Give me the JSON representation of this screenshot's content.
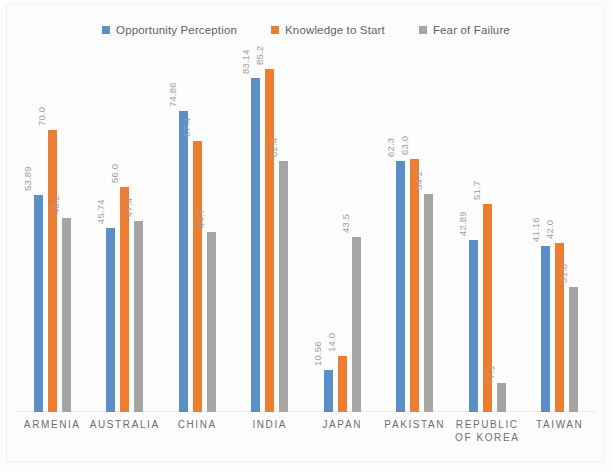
{
  "legend": {
    "position": "top-center",
    "entries": [
      {
        "label": "Opportunity Perception",
        "color": "#5B8FC7",
        "icon": "square-marker"
      },
      {
        "label": "Knowledge to Start",
        "color": "#ED7D31",
        "icon": "square-marker"
      },
      {
        "label": "Fear of Failure",
        "color": "#A5A5A5",
        "icon": "square-marker"
      }
    ]
  },
  "chart_data": {
    "type": "bar",
    "title": "",
    "subtitle": "",
    "xlabel": "",
    "ylabel": "",
    "ylim": [
      0,
      90
    ],
    "grid": false,
    "legend_position": "top-center",
    "categories": [
      "ARMENIA",
      "AUSTRALIA",
      "CHINA",
      "INDIA",
      "JAPAN",
      "PAKISTAN",
      "REPUBLIC\nOF KOREA",
      "TAIWAN"
    ],
    "series": [
      {
        "name": "Opportunity Perception",
        "color": "#5B8FC7",
        "values": [
          53.89,
          45.74,
          74.86,
          83.14,
          10.56,
          62.3,
          42.89,
          41.16
        ],
        "labels": [
          "53.89",
          "45.74",
          "74.86",
          "83.14",
          "10.56",
          "62.3",
          "42.89",
          "41.16"
        ]
      },
      {
        "name": "Knowledge to Start",
        "color": "#ED7D31",
        "values": [
          70.0,
          56.0,
          67.4,
          85.2,
          14.0,
          63.0,
          51.7,
          42.0
        ],
        "labels": [
          "70.0",
          "56.0",
          "67.4",
          "85.2",
          "14.0",
          "63.0",
          "51.7",
          "42.0"
        ]
      },
      {
        "name": "Fear of Failure",
        "color": "#A5A5A5",
        "values": [
          48.2,
          47.4,
          44.7,
          62.4,
          43.5,
          54.2,
          7.1,
          31.0
        ],
        "labels": [
          "48.2",
          "47.4",
          "44.7",
          "62.4",
          "43.5",
          "54.2",
          "7.1",
          "31.0"
        ]
      }
    ]
  }
}
